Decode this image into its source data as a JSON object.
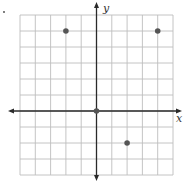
{
  "chart_data": {
    "type": "scatter",
    "title": "",
    "xlabel": "x",
    "ylabel": "y",
    "xlim": [
      -5,
      5
    ],
    "ylim": [
      -4,
      6
    ],
    "grid": true,
    "grid_step": 1,
    "tick_labels": false,
    "points": [
      {
        "x": -2,
        "y": 5
      },
      {
        "x": 4,
        "y": 5
      },
      {
        "x": 0,
        "y": 0
      },
      {
        "x": 2,
        "y": -2
      }
    ]
  },
  "labels": {
    "x_axis": "x",
    "y_axis": "y"
  },
  "colors": {
    "grid": "#bdbdbd",
    "axis": "#2a2a2a",
    "point": "#555555",
    "grid_border": "#c8c8c8"
  }
}
